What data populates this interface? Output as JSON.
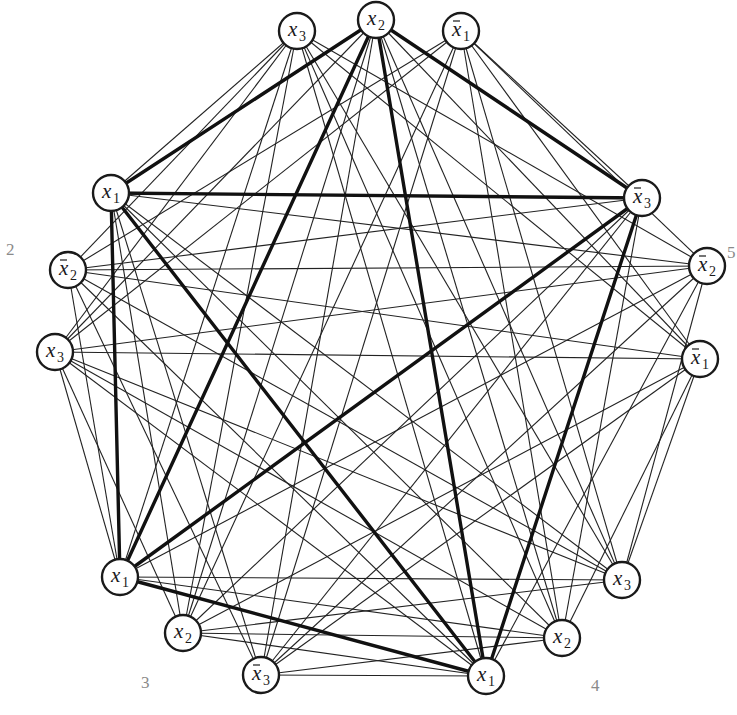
{
  "figure": {
    "type": "clique-reduction-graph",
    "group_labels": [
      {
        "text": "2",
        "x": 6,
        "y": 240
      },
      {
        "text": "5",
        "x": 727,
        "y": 243
      },
      {
        "text": "3",
        "x": 141,
        "y": 673
      },
      {
        "text": "4",
        "x": 591,
        "y": 676
      }
    ],
    "node_radius": 18,
    "groups": [
      {
        "id": 1,
        "nodes": [
          {
            "var": "x",
            "sub": "3",
            "neg": false,
            "cx": 297,
            "cy": 31
          },
          {
            "var": "x",
            "sub": "2",
            "neg": false,
            "cx": 376,
            "cy": 20
          },
          {
            "var": "x",
            "sub": "1",
            "neg": true,
            "cx": 461,
            "cy": 31
          }
        ]
      },
      {
        "id": 2,
        "nodes": [
          {
            "var": "x",
            "sub": "1",
            "neg": false,
            "cx": 111,
            "cy": 193
          },
          {
            "var": "x",
            "sub": "2",
            "neg": true,
            "cx": 68,
            "cy": 270
          },
          {
            "var": "x",
            "sub": "3",
            "neg": false,
            "cx": 55,
            "cy": 352
          }
        ]
      },
      {
        "id": 3,
        "nodes": [
          {
            "var": "x",
            "sub": "1",
            "neg": false,
            "cx": 120,
            "cy": 577
          },
          {
            "var": "x",
            "sub": "2",
            "neg": false,
            "cx": 183,
            "cy": 633
          },
          {
            "var": "x",
            "sub": "3",
            "neg": true,
            "cx": 261,
            "cy": 675
          }
        ]
      },
      {
        "id": 4,
        "nodes": [
          {
            "var": "x",
            "sub": "1",
            "neg": false,
            "cx": 486,
            "cy": 676
          },
          {
            "var": "x",
            "sub": "2",
            "neg": false,
            "cx": 562,
            "cy": 638
          },
          {
            "var": "x",
            "sub": "3",
            "neg": false,
            "cx": 622,
            "cy": 580
          }
        ]
      },
      {
        "id": 5,
        "nodes": [
          {
            "var": "x",
            "sub": "3",
            "neg": true,
            "cx": 642,
            "cy": 198
          },
          {
            "var": "x",
            "sub": "2",
            "neg": true,
            "cx": 707,
            "cy": 266
          },
          {
            "var": "x",
            "sub": "1",
            "neg": true,
            "cx": 700,
            "cy": 359
          }
        ]
      }
    ],
    "edge_rule": "connect literals in different groups unless they are complementary (x_i vs not x_i)",
    "highlighted_clique": [
      {
        "group": 1,
        "index": 1
      },
      {
        "group": 2,
        "index": 0
      },
      {
        "group": 3,
        "index": 0
      },
      {
        "group": 4,
        "index": 0
      },
      {
        "group": 5,
        "index": 0
      }
    ],
    "colors": {
      "edge": "#222222",
      "highlight_edge": "#111111",
      "node_stroke": "#1a1a1a",
      "node_fill": "#ffffff",
      "group_label": "#8a8a8a"
    }
  }
}
